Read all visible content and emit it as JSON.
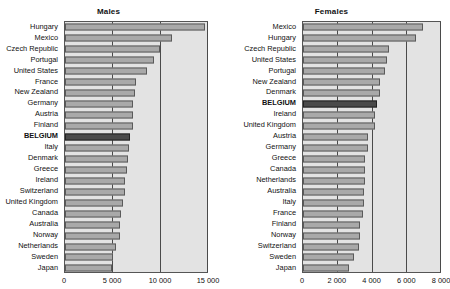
{
  "top_cut_text": "",
  "colors": {
    "bar_fill": "#a9a9a9",
    "bar_stroke": "#5a5a5a",
    "highlight_fill": "#4a4a4a",
    "plot_background": "#e3e3e3",
    "axis": "#555555"
  },
  "panels": {
    "males": {
      "title": "Males"
    },
    "females": {
      "title": "Females"
    }
  },
  "chart_data": [
    {
      "type": "bar",
      "orientation": "horizontal",
      "title": "Males",
      "xlabel": "",
      "ylabel": "",
      "xlim": [
        0,
        15000
      ],
      "xticks": [
        0,
        5000,
        10000,
        15000
      ],
      "xtick_labels": [
        "0",
        "5 000",
        "10 000",
        "15 000"
      ],
      "grid": true,
      "legend": "none",
      "highlight_category": "BELGIUM",
      "categories": [
        "Hungary",
        "Mexico",
        "Czech Republic",
        "Portugal",
        "United States",
        "France",
        "New Zealand",
        "Germany",
        "Austria",
        "Finland",
        "BELGIUM",
        "Italy",
        "Denmark",
        "Greece",
        "Ireland",
        "Switzerland",
        "United Kingdom",
        "Canada",
        "Australia",
        "Norway",
        "Netherlands",
        "Sweden",
        "Japan"
      ],
      "values": [
        14800,
        11300,
        10000,
        9400,
        8700,
        7500,
        7400,
        7200,
        7200,
        7200,
        6900,
        6800,
        6700,
        6500,
        6300,
        6300,
        6100,
        5900,
        5800,
        5800,
        5400,
        5100,
        5000
      ]
    },
    {
      "type": "bar",
      "orientation": "horizontal",
      "title": "Females",
      "xlabel": "",
      "ylabel": "",
      "xlim": [
        0,
        8000
      ],
      "xticks": [
        0,
        2000,
        4000,
        6000,
        8000
      ],
      "xtick_labels": [
        "0",
        "2 000",
        "4 000",
        "6 000",
        "8 000"
      ],
      "grid": true,
      "legend": "none",
      "highlight_category": "BELGIUM",
      "categories": [
        "Mexico",
        "Hungary",
        "Czech Republic",
        "United States",
        "Portugal",
        "New Zealand",
        "Denmark",
        "BELGIUM",
        "Ireland",
        "United Kingdom",
        "Austria",
        "Germany",
        "Greece",
        "Canada",
        "Netherlands",
        "Australia",
        "Italy",
        "France",
        "Finland",
        "Norway",
        "Switzerland",
        "Sweden",
        "Japan"
      ],
      "values": [
        7000,
        6600,
        5000,
        4900,
        4800,
        4500,
        4500,
        4300,
        4200,
        4200,
        3800,
        3800,
        3600,
        3600,
        3600,
        3550,
        3550,
        3500,
        3350,
        3300,
        3250,
        3000,
        2700
      ]
    }
  ]
}
